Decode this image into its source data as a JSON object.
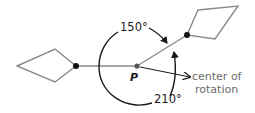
{
  "diagram": {
    "angle_ccw_label": "150°",
    "angle_cw_label": "210°",
    "center_label": "P",
    "annotation_line1": "center of",
    "annotation_line2": "rotation",
    "colors": {
      "shape_stroke": "#8a8a8a",
      "arc_stroke": "#1a1a1a",
      "annotation_text": "#6b6b6b"
    }
  }
}
